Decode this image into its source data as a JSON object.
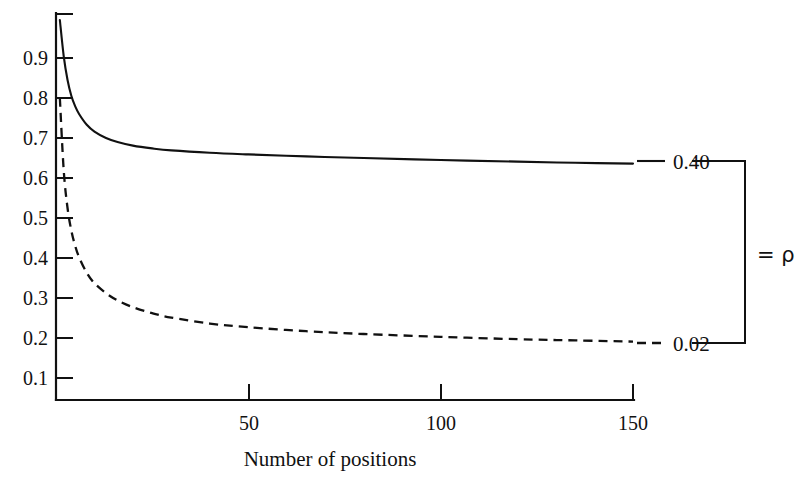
{
  "chart_data": {
    "type": "line",
    "title": "",
    "xlabel": "Number of positions",
    "ylabel": "",
    "xlim": [
      0,
      150
    ],
    "ylim": [
      0.0,
      1.0
    ],
    "grid": false,
    "legend_position": "right-outside",
    "x_ticks": [
      {
        "value": 50,
        "label": "50"
      },
      {
        "value": 100,
        "label": "100"
      },
      {
        "value": 150,
        "label": "150"
      }
    ],
    "y_ticks": [
      {
        "value": 0.9,
        "label": "0.9"
      },
      {
        "value": 0.8,
        "label": "0.8"
      },
      {
        "value": 0.7,
        "label": "0.7"
      },
      {
        "value": 0.6,
        "label": "0.6"
      },
      {
        "value": 0.5,
        "label": "0.5"
      },
      {
        "value": 0.4,
        "label": "0.4"
      },
      {
        "value": 0.3,
        "label": "0.3"
      },
      {
        "value": 0.2,
        "label": "0.2"
      },
      {
        "value": 0.1,
        "label": "0.1"
      }
    ],
    "annotations": [
      {
        "text": "= ρ",
        "role": "bracket-label"
      }
    ],
    "series": [
      {
        "name": "rho = 0.40",
        "label": "0.40",
        "style": "solid",
        "color": "#111111",
        "x": [
          1,
          2,
          3,
          4,
          5,
          6,
          8,
          10,
          13,
          16,
          20,
          25,
          30,
          40,
          50,
          65,
          80,
          100,
          120,
          135,
          150
        ],
        "values": [
          0.995,
          0.905,
          0.845,
          0.805,
          0.779,
          0.76,
          0.733,
          0.716,
          0.7,
          0.69,
          0.681,
          0.674,
          0.669,
          0.663,
          0.659,
          0.654,
          0.65,
          0.645,
          0.641,
          0.638,
          0.636
        ]
      },
      {
        "name": "rho = 0.02",
        "label": "0.02",
        "style": "dashed",
        "color": "#111111",
        "x": [
          1,
          2,
          3,
          4,
          5,
          6,
          8,
          10,
          13,
          16,
          20,
          25,
          30,
          40,
          50,
          65,
          80,
          100,
          120,
          135,
          150
        ],
        "values": [
          0.8,
          0.62,
          0.525,
          0.468,
          0.43,
          0.402,
          0.363,
          0.337,
          0.312,
          0.294,
          0.277,
          0.262,
          0.251,
          0.236,
          0.227,
          0.217,
          0.21,
          0.203,
          0.197,
          0.194,
          0.191
        ]
      }
    ]
  },
  "axes": {
    "x_title": "Number of positions"
  },
  "legend": {
    "top_label": "0.40",
    "bottom_label": "0.02",
    "bracket_label": "= ρ"
  },
  "colors": {
    "ink": "#111111",
    "background": "#ffffff"
  }
}
